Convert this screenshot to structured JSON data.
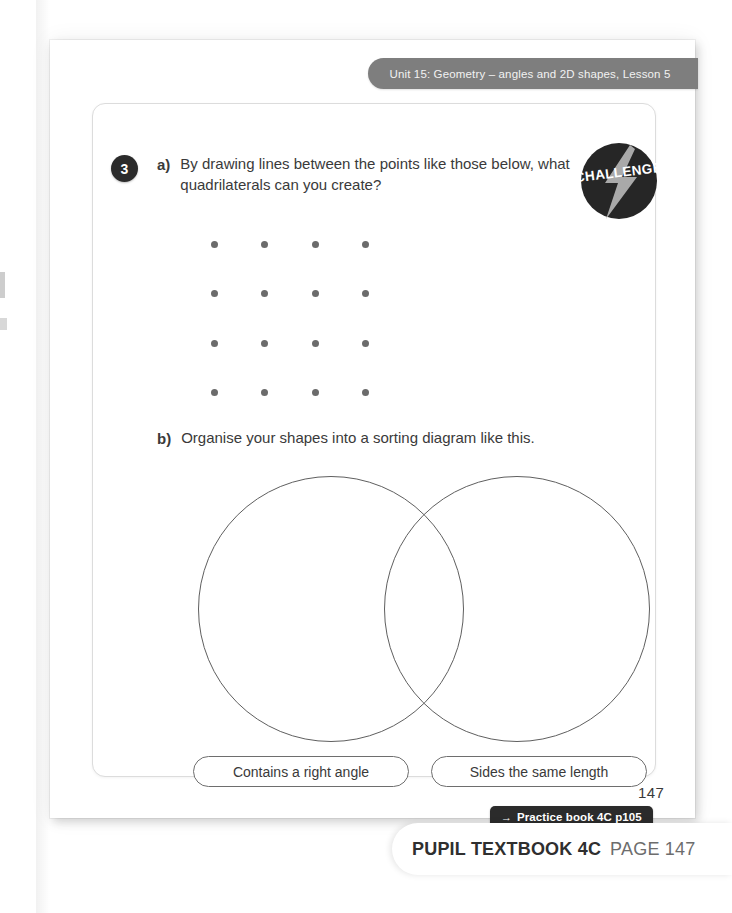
{
  "header": {
    "unit_label": "Unit 15: Geometry – angles and 2D shapes, Lesson 5",
    "band_color": "#7e7e7e"
  },
  "badge": {
    "label": "CHALLENGE",
    "icon": "lightning-bolt-icon",
    "circle_color": "#262626",
    "bolt_color": "#b3b3b3"
  },
  "question": {
    "number": "3",
    "parts": [
      {
        "label": "a)",
        "text": "By drawing lines between the points like those below, what quadrilaterals can you create?"
      },
      {
        "label": "b)",
        "text": "Organise your shapes into a sorting diagram like this."
      }
    ]
  },
  "dot_grid": {
    "rows": 4,
    "cols": 4,
    "dot_color": "#6b6b6b",
    "col_x": [
      0,
      50,
      101,
      151
    ],
    "row_y": [
      0,
      49,
      99,
      148
    ]
  },
  "venn": {
    "circle_color": "#5f5f5f",
    "labels": [
      "Contains a right angle",
      "Sides the same length"
    ]
  },
  "footer": {
    "practice_arrow": "→",
    "practice_book": "Practice book 4C p105",
    "page_folio": "147"
  },
  "caption": {
    "book": "PUPIL TEXTBOOK 4C",
    "page": "PAGE 147"
  }
}
